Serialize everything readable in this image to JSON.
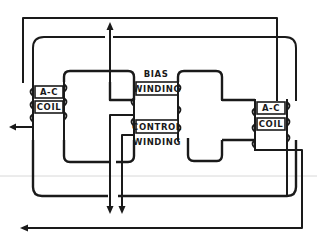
{
  "diagram": {
    "type": "magnetic amplifier schematic",
    "ink_color": "#1a1a1a",
    "background": "#ffffff",
    "labels": {
      "left_ac_coil_line1": "A-C",
      "left_ac_coil_line2": "COIL",
      "right_ac_coil_line1": "A-C",
      "right_ac_coil_line2": "COIL",
      "bias_winding_line1": "BIAS",
      "bias_winding_line2": "WINDING",
      "control_winding_line1": "CONTROL",
      "control_winding_line2": "WINDING"
    },
    "components": [
      {
        "name": "left-ac-coil",
        "label": "A-C COIL"
      },
      {
        "name": "right-ac-coil",
        "label": "A-C COIL"
      },
      {
        "name": "bias-winding",
        "label": "BIAS WINDING"
      },
      {
        "name": "control-winding",
        "label": "CONTROL WINDING"
      }
    ],
    "arrows": [
      {
        "name": "bias-lead-up-arrow",
        "direction": "up"
      },
      {
        "name": "left-output-arrow",
        "direction": "left"
      },
      {
        "name": "control-lead-down-arrow-1",
        "direction": "down"
      },
      {
        "name": "control-lead-down-arrow-2",
        "direction": "down"
      },
      {
        "name": "bottom-return-arrow",
        "direction": "left"
      }
    ]
  }
}
